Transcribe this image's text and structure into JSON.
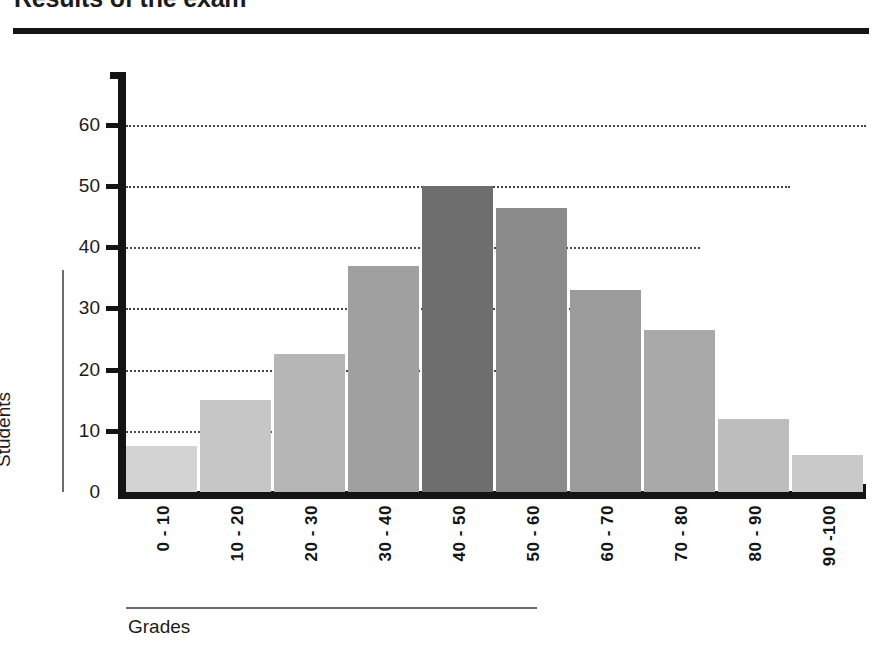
{
  "title": "Results of the exam",
  "axis_titles": {
    "y": "Students",
    "x": "Grades"
  },
  "chart_data": {
    "type": "bar",
    "title": "Results of the exam",
    "xlabel": "Grades",
    "ylabel": "Students",
    "categories": [
      "0 - 10",
      "10 - 20",
      "20 - 30",
      "30 - 40",
      "40 - 50",
      "50 - 60",
      "60 - 70",
      "70 - 80",
      "80 - 90",
      "90 -100"
    ],
    "values": [
      7.5,
      15,
      22.5,
      37,
      50,
      46.5,
      33,
      26.5,
      12,
      6
    ],
    "ylim": [
      0,
      65
    ],
    "yticks": [
      0,
      10,
      20,
      30,
      40,
      50,
      60
    ],
    "ytick_labels": [
      "0",
      "10",
      "20",
      "30",
      "40",
      "50",
      "60"
    ],
    "grid": "horizontal-dotted",
    "legend": "none",
    "bar_colors": [
      "#d3d3d3",
      "#c6c6c6",
      "#b6b6b6",
      "#a0a0a0",
      "#6e6e6e",
      "#8b8b8b",
      "#9b9b9b",
      "#a9a9a9",
      "#bdbdbd",
      "#c9c9c9"
    ]
  },
  "colors": {
    "axis": "#141414",
    "grid": "#444444",
    "rule": "#6d6d6d",
    "text": "#1b1b1b"
  }
}
